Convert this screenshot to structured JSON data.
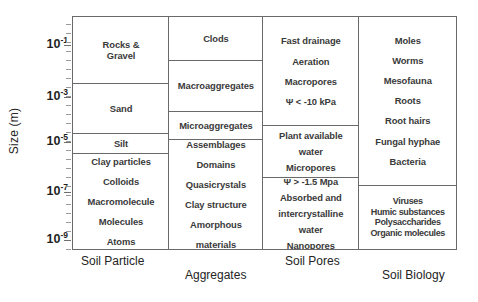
{
  "axis": {
    "title": "Size (m)",
    "ticks": [
      {
        "label_base": "10",
        "label_exp": "-1",
        "y": 45
      },
      {
        "label_base": "10",
        "label_exp": "-3",
        "y": 97
      },
      {
        "label_base": "10",
        "label_exp": "-5",
        "y": 142
      },
      {
        "label_base": "10",
        "label_exp": "-7",
        "y": 192
      },
      {
        "label_base": "10",
        "label_exp": "-9",
        "y": 240
      }
    ]
  },
  "categories": {
    "soil_particle": "Soil Particle",
    "aggregates": "Aggregates",
    "soil_pores": "Soil Pores",
    "soil_biology": "Soil Biology"
  },
  "chart_data": {
    "type": "table",
    "ylabel": "Size (m)",
    "ytick_labels": [
      "10-1",
      "10-3",
      "10-5",
      "10-7",
      "10-9"
    ],
    "ylim_log10": [
      -1,
      -9
    ],
    "grid": false,
    "legend": "none",
    "columns": [
      {
        "name": "Soil Particle",
        "cells": [
          {
            "lines": [
              "Rocks &",
              "Gravel"
            ]
          },
          {
            "lines": [
              "Sand"
            ]
          },
          {
            "lines": [
              "Silt"
            ]
          },
          {
            "lines": [
              "Clay particles",
              "Colloids",
              "Macromolecule",
              "Molecules",
              "Atoms"
            ]
          }
        ]
      },
      {
        "name": "Aggregates",
        "cells": [
          {
            "lines": [
              "Clods"
            ]
          },
          {
            "lines": [
              "Macroaggregates"
            ]
          },
          {
            "lines": [
              "Microaggregates"
            ]
          },
          {
            "lines": [
              "Assemblages",
              "Domains",
              "Quasicrystals",
              "Clay structure",
              "Amorphous",
              "materials"
            ]
          }
        ]
      },
      {
        "name": "Soil Pores",
        "cells": [
          {
            "lines": [
              "Fast drainage",
              "Aeration",
              "Macropores",
              "Ψ < -10 kPa"
            ]
          },
          {
            "lines": [
              "Plant available",
              "water",
              "Micropores"
            ]
          },
          {
            "lines": [
              "Ψ > -1.5 Mpa",
              "Absorbed and",
              "intercrystalline",
              "water",
              "Nanopores"
            ]
          }
        ]
      },
      {
        "name": "Soil Biology",
        "cells": [
          {
            "lines": [
              "Moles",
              "Worms",
              "Mesofauna",
              "Roots",
              "Root hairs",
              "Fungal hyphae",
              "Bacteria"
            ]
          },
          {
            "lines": [
              "Viruses",
              "Humic substances",
              "Polysaccharides",
              "Organic molecules"
            ]
          }
        ]
      }
    ]
  }
}
